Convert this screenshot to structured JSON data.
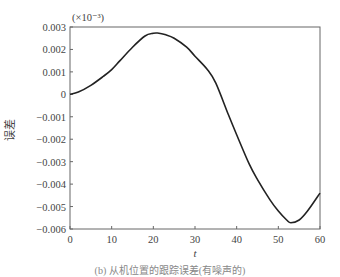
{
  "chart_data": {
    "type": "line",
    "title": "",
    "xlabel": "t",
    "ylabel": "误差",
    "y_scale_annotation": "(×10⁻³)",
    "xlim": [
      0,
      60
    ],
    "ylim": [
      -0.006,
      0.003
    ],
    "grid": false,
    "legend": null,
    "x_ticks": [
      0,
      10,
      20,
      30,
      40,
      50,
      60
    ],
    "x_tick_labels": [
      "0",
      "10",
      "20",
      "30",
      "40",
      "50",
      "60"
    ],
    "y_ticks": [
      0.003,
      0.002,
      0.001,
      0,
      -0.001,
      -0.002,
      -0.003,
      -0.004,
      -0.005,
      -0.006
    ],
    "y_tick_labels": [
      "0.003",
      "0.002",
      "0.001",
      "0",
      "−0.001",
      "−0.002",
      "−0.003",
      "−0.004",
      "−0.005",
      "−0.006"
    ],
    "series": [
      {
        "name": "误差",
        "color": "#222222",
        "x": [
          0,
          2,
          5,
          8,
          10,
          12,
          15,
          18,
          20,
          21,
          23,
          25,
          28,
          30,
          33,
          35,
          38,
          40,
          43,
          45,
          48,
          50,
          52,
          53,
          55,
          57,
          60
        ],
        "values": [
          0,
          0.0001,
          0.0004,
          0.0008,
          0.0011,
          0.0015,
          0.0021,
          0.0026,
          0.00272,
          0.00273,
          0.00265,
          0.0025,
          0.0021,
          0.0017,
          0.0011,
          0.0005,
          -0.0009,
          -0.0018,
          -0.0031,
          -0.0038,
          -0.0047,
          -0.0052,
          -0.0056,
          -0.00572,
          -0.0056,
          -0.0052,
          -0.0044
        ]
      }
    ]
  },
  "caption": "(b) 从机位置的跟踪误差(有噪声的)"
}
